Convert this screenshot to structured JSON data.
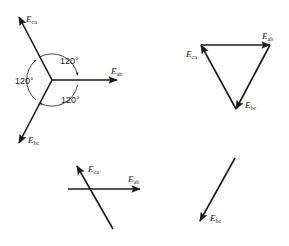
{
  "diagram": {
    "type": "phasor-diagrams",
    "colors": {
      "ink": "#1a1a1a",
      "background": "#ffffff"
    },
    "panels": [
      {
        "id": "star",
        "vectors": [
          {
            "label": "E",
            "sub": "ab"
          },
          {
            "label": "E",
            "sub": "ca"
          },
          {
            "label": "E",
            "sub": "bc"
          }
        ],
        "angles": [
          "120°",
          "120°",
          "120°"
        ]
      },
      {
        "id": "triangle",
        "vectors": [
          {
            "label": "E",
            "sub": "ab"
          },
          {
            "label": "E",
            "sub": "ca"
          },
          {
            "label": "E",
            "sub": "bc"
          }
        ]
      },
      {
        "id": "sum",
        "vectors": [
          {
            "label": "E",
            "sub": "ca"
          },
          {
            "label": "E",
            "sub": "ab"
          }
        ]
      },
      {
        "id": "result",
        "vectors": [
          {
            "label": "E",
            "sub": "bc"
          }
        ]
      }
    ]
  }
}
